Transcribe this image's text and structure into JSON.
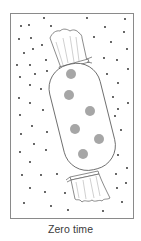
{
  "figure": {
    "caption": "Zero time",
    "colors": {
      "frame": "#8a8a8a",
      "outline": "#5a5a5a",
      "spot": "#a6a6a6",
      "dot": "#222222",
      "background": "#ffffff"
    },
    "spot_count": 6,
    "dot_count": 60
  }
}
